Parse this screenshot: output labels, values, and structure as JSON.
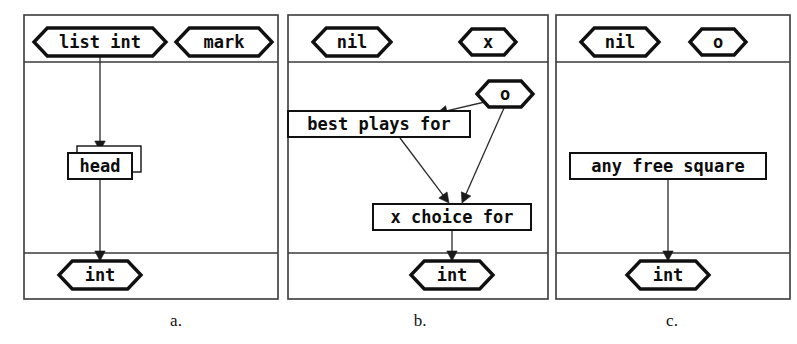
{
  "figure": {
    "width": 797,
    "height": 344,
    "background": "#ffffff",
    "ink_color": "#101010",
    "frame_color": "#3a3a3a",
    "edge_color": "#2b2b2b"
  },
  "panels": [
    {
      "id": "panel-a",
      "caption": "a.",
      "caption_x": 176,
      "caption_y": 322,
      "frame": {
        "x": 24,
        "y": 15,
        "w": 254,
        "h": 284
      },
      "header_divider_y": 62,
      "footer_divider_y": 253,
      "header_nodes": [
        {
          "id": "a-list-int",
          "label": "list int",
          "shape": "hexagon",
          "cx": 100,
          "cy": 42,
          "w": 132,
          "h": 28,
          "font_size": 17
        },
        {
          "id": "a-mark",
          "label": "mark",
          "shape": "hexagon",
          "cx": 224,
          "cy": 42,
          "w": 96,
          "h": 28,
          "font_size": 17
        }
      ],
      "body_nodes": [
        {
          "id": "a-head",
          "label": "head",
          "shape": "box-stacked",
          "cx": 100,
          "cy": 166,
          "w": 64,
          "h": 26,
          "font_size": 17
        }
      ],
      "footer_nodes": [
        {
          "id": "a-int",
          "label": "int",
          "shape": "hexagon",
          "cx": 100,
          "cy": 275,
          "w": 82,
          "h": 28,
          "font_size": 17
        }
      ],
      "edges": [
        {
          "id": "a-edge-listint-head",
          "from": "a-list-int",
          "to": "a-head",
          "x1": 100,
          "y1": 56,
          "x2": 100,
          "y2": 151,
          "arrow": true
        },
        {
          "id": "a-edge-head-int",
          "from": "a-head",
          "to": "a-int",
          "x1": 100,
          "y1": 179,
          "x2": 100,
          "y2": 261,
          "arrow": true
        }
      ]
    },
    {
      "id": "panel-b",
      "caption": "b.",
      "caption_x": 420,
      "caption_y": 322,
      "frame": {
        "x": 288,
        "y": 15,
        "w": 260,
        "h": 284
      },
      "header_divider_y": 62,
      "footer_divider_y": 253,
      "header_nodes": [
        {
          "id": "b-nil",
          "label": "nil",
          "shape": "hexagon",
          "cx": 352,
          "cy": 42,
          "w": 78,
          "h": 28,
          "font_size": 17
        },
        {
          "id": "b-x",
          "label": "x",
          "shape": "hexagon",
          "cx": 488,
          "cy": 42,
          "w": 56,
          "h": 26,
          "font_size": 17
        }
      ],
      "body_nodes": [
        {
          "id": "b-o",
          "label": "o",
          "shape": "hexagon",
          "cx": 505,
          "cy": 94,
          "w": 56,
          "h": 26,
          "font_size": 17
        },
        {
          "id": "b-best-plays-for",
          "label": "best plays for",
          "shape": "box",
          "cx": 379,
          "cy": 124,
          "w": 182,
          "h": 26,
          "font_size": 17
        },
        {
          "id": "b-x-choice-for",
          "label": "x choice for",
          "shape": "box",
          "cx": 452,
          "cy": 217,
          "w": 158,
          "h": 26,
          "font_size": 17
        }
      ],
      "footer_nodes": [
        {
          "id": "b-int",
          "label": "int",
          "shape": "hexagon",
          "cx": 452,
          "cy": 275,
          "w": 82,
          "h": 28,
          "font_size": 17
        }
      ],
      "edges": [
        {
          "id": "b-edge-o-bestplays",
          "from": "b-o",
          "to": "b-best-plays-for",
          "x1": 489,
          "y1": 101,
          "x2": 437,
          "y2": 113,
          "arrow": true
        },
        {
          "id": "b-edge-bestplays-xchoice",
          "from": "b-best-plays-for",
          "to": "b-x-choice-for",
          "x1": 400,
          "y1": 138,
          "x2": 449,
          "y2": 203,
          "arrow": true
        },
        {
          "id": "b-edge-o-xchoice",
          "from": "b-o",
          "to": "b-x-choice-for",
          "x1": 504,
          "y1": 108,
          "x2": 462,
          "y2": 203,
          "arrow": true
        },
        {
          "id": "b-edge-xchoice-int",
          "from": "b-x-choice-for",
          "to": "b-int",
          "x1": 452,
          "y1": 231,
          "x2": 452,
          "y2": 261,
          "arrow": true
        }
      ]
    },
    {
      "id": "panel-c",
      "caption": "c.",
      "caption_x": 672,
      "caption_y": 322,
      "frame": {
        "x": 556,
        "y": 15,
        "w": 234,
        "h": 284
      },
      "header_divider_y": 62,
      "footer_divider_y": 253,
      "header_nodes": [
        {
          "id": "c-nil",
          "label": "nil",
          "shape": "hexagon",
          "cx": 620,
          "cy": 42,
          "w": 78,
          "h": 28,
          "font_size": 17
        },
        {
          "id": "c-o",
          "label": "o",
          "shape": "hexagon",
          "cx": 718,
          "cy": 42,
          "w": 56,
          "h": 26,
          "font_size": 17
        }
      ],
      "body_nodes": [
        {
          "id": "c-any-free-square",
          "label": "any free square",
          "shape": "box",
          "cx": 668,
          "cy": 166,
          "w": 196,
          "h": 26,
          "font_size": 17
        }
      ],
      "footer_nodes": [
        {
          "id": "c-int",
          "label": "int",
          "shape": "hexagon",
          "cx": 668,
          "cy": 275,
          "w": 82,
          "h": 28,
          "font_size": 17
        }
      ],
      "edges": [
        {
          "id": "c-edge-anyfree-int",
          "from": "c-any-free-square",
          "to": "c-int",
          "x1": 668,
          "y1": 180,
          "x2": 668,
          "y2": 261,
          "arrow": true
        }
      ]
    }
  ]
}
